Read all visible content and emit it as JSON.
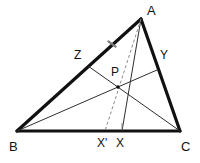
{
  "figure": {
    "kind": "geometry-diagram",
    "background_color": "#ffffff",
    "stroke_color": "#111111",
    "thin_stroke_color": "#3a3a3a",
    "dashed_stroke_color": "#8a8a8a",
    "tick_color": "#7d7d7d",
    "point_fill": "#111111",
    "side_stroke_width": 3.2,
    "cevian_stroke_width": 1.0,
    "dashed_stroke_width": 1.0,
    "vertices": [
      {
        "id": "A",
        "label": "A",
        "x": 141,
        "y": 19,
        "label_x": 147,
        "label_y": 4
      },
      {
        "id": "B",
        "label": "B",
        "x": 17,
        "y": 131,
        "label_x": 9,
        "label_y": 140
      },
      {
        "id": "C",
        "label": "C",
        "x": 180,
        "y": 131,
        "label_x": 181,
        "label_y": 140
      }
    ],
    "points": [
      {
        "id": "Z",
        "label": "Z",
        "x": 88,
        "y": 66,
        "label_x": 74,
        "label_y": 49,
        "on_segment": "AB"
      },
      {
        "id": "Y",
        "label": "Y",
        "x": 157,
        "y": 70,
        "label_x": 160,
        "label_y": 49,
        "on_segment": "AC"
      },
      {
        "id": "P",
        "label": "P",
        "x": 118,
        "y": 87,
        "label_x": 111,
        "label_y": 66,
        "on_segment": "intersection"
      },
      {
        "id": "Xprime",
        "label": "X'",
        "x": 105,
        "y": 131,
        "label_x": 97,
        "label_y": 137,
        "on_segment": "BC"
      },
      {
        "id": "X",
        "label": "X",
        "x": 122,
        "y": 131,
        "label_x": 116,
        "label_y": 137,
        "on_segment": "BC"
      }
    ],
    "sides": [
      {
        "id": "AB",
        "from": "A",
        "to": "B",
        "style": "solid-thick"
      },
      {
        "id": "AC",
        "from": "A",
        "to": "C",
        "style": "solid-thick"
      },
      {
        "id": "BC",
        "from": "B",
        "to": "C",
        "style": "solid-thick"
      }
    ],
    "cevians": [
      {
        "id": "BY",
        "from": "B",
        "to": "Y",
        "style": "solid-thin"
      },
      {
        "id": "CZ",
        "from": "C",
        "to": "Z",
        "style": "solid-thin"
      },
      {
        "id": "AX",
        "from": "A",
        "to": "X",
        "style": "solid-thin"
      }
    ],
    "dashed_lines": [
      {
        "id": "AXprime",
        "from": "A",
        "to": "Xprime",
        "style": "dashed"
      }
    ],
    "tick_marks": [
      {
        "id": "tick-AB",
        "x": 112,
        "y": 44,
        "angle_deg": 42,
        "length": 7,
        "on_segment": "AB"
      },
      {
        "id": "tick-X",
        "x": 122,
        "y": 126,
        "angle_deg": 90,
        "length": 6,
        "on_segment": "BC"
      }
    ]
  }
}
